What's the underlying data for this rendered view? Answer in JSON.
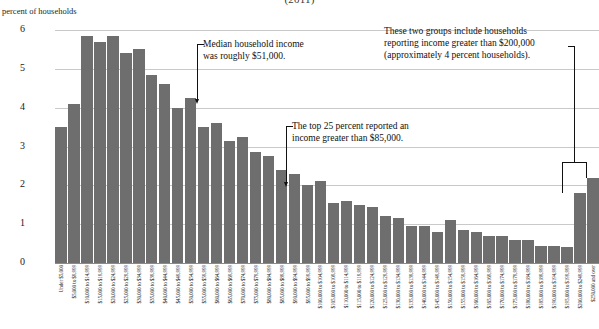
{
  "chart_data": {
    "type": "bar",
    "title": "(2011)",
    "xlabel": "",
    "ylabel": "percent of households",
    "ylim": [
      0,
      6
    ],
    "yticks": [
      0,
      1,
      2,
      3,
      4,
      5,
      6
    ],
    "grid": true,
    "legend": null,
    "bar_color": "#6e6e6e",
    "categories": [
      "Under $5,000",
      "$5,000 to $9,999",
      "$10,000 to $14,999",
      "$15,000 to $19,999",
      "$20,000 to $24,999",
      "$25,000 to $29,999",
      "$30,000 to $34,999",
      "$35,000 to $39,999",
      "$40,000 to $44,999",
      "$45,000 to $49,999",
      "$50,000 to $54,999",
      "$55,000 to $59,999",
      "$60,000 to $64,999",
      "$65,000 to $69,999",
      "$70,000 to $74,999",
      "$75,000 to $79,999",
      "$80,000 to $84,999",
      "$85,000 to $89,999",
      "$90,000 to $94,999",
      "$95,000 to $99,999",
      "$100,000 to $104,999",
      "$105,000 to $109,999",
      "$110,000 to $114,999",
      "$115,000 to $119,999",
      "$120,000 to $124,999",
      "$125,000 to $129,999",
      "$130,000 to $134,999",
      "$135,000 to $139,999",
      "$140,000 to $144,999",
      "$145,000 to $149,999",
      "$150,000 to $154,999",
      "$155,000 to $159,999",
      "$160,000 to $164,999",
      "$165,000 to $169,999",
      "$170,000 to $174,999",
      "$175,000 to $179,999",
      "$180,000 to $184,999",
      "$185,000 to $189,999",
      "$190,000 to $194,999",
      "$195,000 to $199,999",
      "$200,000 to $249,999",
      "$250,000 and over"
    ],
    "values": [
      3.5,
      4.1,
      5.85,
      5.7,
      5.85,
      5.4,
      5.5,
      4.85,
      4.6,
      4.0,
      4.25,
      3.5,
      3.6,
      3.15,
      3.25,
      2.85,
      2.75,
      2.4,
      2.3,
      2.0,
      2.1,
      1.55,
      1.6,
      1.5,
      1.45,
      1.2,
      1.15,
      0.95,
      0.95,
      0.8,
      1.1,
      0.85,
      0.8,
      0.7,
      0.7,
      0.6,
      0.6,
      0.45,
      0.45,
      0.4,
      1.8,
      2.2
    ]
  },
  "annotations": {
    "median": "Median household income\nwas roughly $51,000.",
    "top25": "The top 25 percent reported an\nincome greater than $85,000.",
    "high_income": "These two groups include households\nreporting income greater than $200,000\n(approximately 4 percent households)."
  }
}
